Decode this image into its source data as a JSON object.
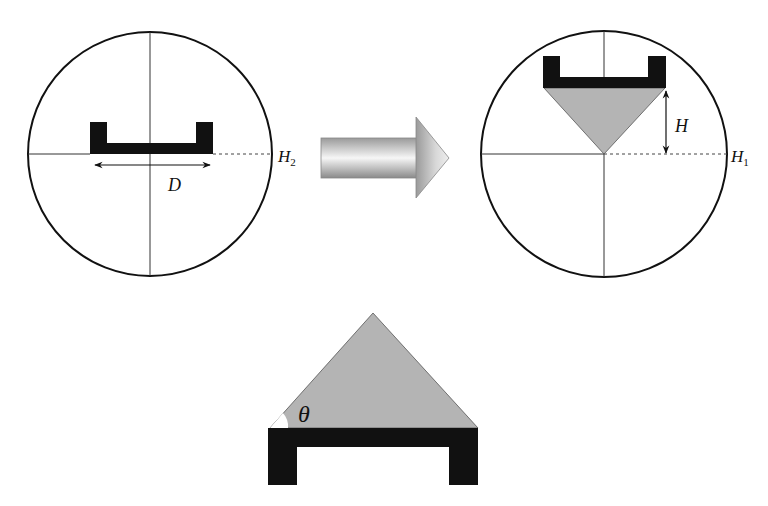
{
  "labels": {
    "left_height": "H",
    "left_height_sub": "2",
    "width": "D",
    "right_height": "H",
    "right_height_sub": "1",
    "fill_height": "H",
    "angle": "θ"
  },
  "colors": {
    "outline": "#111111",
    "channel": "#111111",
    "fill": "#b4b4b4",
    "arrow_light": "#f4f4f4",
    "arrow_dark": "#8a8a8a"
  },
  "panels": [
    {
      "name": "before",
      "description": "Empty U-channel in circle with width D at level H2"
    },
    {
      "name": "after",
      "description": "U-channel with triangular pile of height H, apex at level H1"
    },
    {
      "name": "detail",
      "description": "Triangular pile on U-channel with repose angle theta"
    }
  ]
}
